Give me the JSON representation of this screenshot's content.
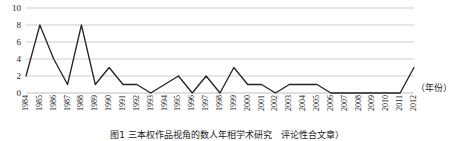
{
  "chart_data": {
    "type": "line",
    "title": "",
    "xlabel": "(年份)",
    "ylabel": "",
    "ylim": [
      0,
      10
    ],
    "yticks": [
      0,
      2,
      4,
      6,
      8,
      10
    ],
    "grid": true,
    "legend": "none",
    "categories": [
      "1984",
      "1985",
      "1986",
      "1987",
      "1988",
      "1989",
      "1990",
      "1991",
      "1992",
      "1993",
      "1994",
      "1995",
      "1996",
      "1997",
      "1998",
      "1999",
      "2000",
      "2001",
      "2002",
      "2003",
      "2004",
      "2005",
      "2006",
      "2007",
      "2008",
      "2009",
      "2010",
      "2011",
      "2012"
    ],
    "values": [
      2,
      8,
      4,
      1,
      8,
      1,
      3,
      1,
      1,
      0,
      1,
      2,
      0,
      2,
      0,
      3,
      1,
      1,
      0,
      1,
      1,
      1,
      0,
      0,
      0,
      0,
      0,
      0,
      3
    ],
    "series": [
      {
        "name": "发文量",
        "color": "#222222",
        "values": [
          2,
          8,
          4,
          1,
          8,
          1,
          3,
          1,
          1,
          0,
          1,
          2,
          0,
          2,
          0,
          3,
          1,
          1,
          0,
          1,
          1,
          1,
          0,
          0,
          0,
          0,
          0,
          0,
          3
        ]
      }
    ]
  },
  "axis": {
    "x_unit_label": "（年份）",
    "y_tick_labels": [
      "0",
      "2",
      "4",
      "6",
      "8",
      "10"
    ]
  },
  "caption": {
    "text": "图1 三本权作品视角的数人年相学术研究　评论性合文章）"
  },
  "colors": {
    "line": "#222222",
    "grid": "#b7b7b7",
    "background": "#ffffff",
    "text": "#1a1a1a"
  }
}
